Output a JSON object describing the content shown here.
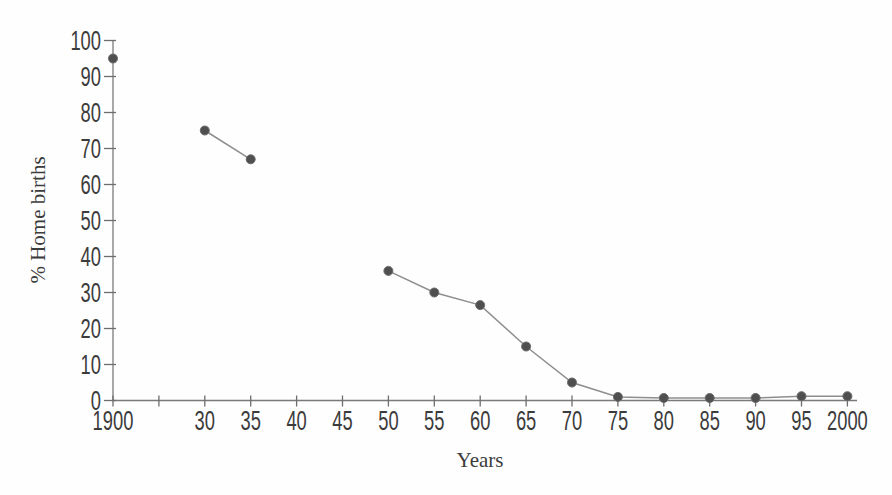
{
  "chart_data": {
    "type": "line",
    "xlabel": "Years",
    "ylabel": "% Home births",
    "x_tick_labels": [
      "1900",
      "",
      "30",
      "35",
      "40",
      "45",
      "50",
      "55",
      "60",
      "65",
      "70",
      "75",
      "80",
      "85",
      "90",
      "95",
      "2000"
    ],
    "y_tick_labels": [
      "0",
      "10",
      "20",
      "30",
      "40",
      "50",
      "60",
      "70",
      "80",
      "90",
      "100"
    ],
    "ylim": [
      0,
      100
    ],
    "grid": false,
    "legend": "none",
    "colors": {
      "axis": "#7a7a7a",
      "tick": "#6e6e6e",
      "text": "#3c3c3c",
      "line": "#8e8e8e",
      "marker": "#4f4f4f",
      "marker_edge": "#6b6b6b"
    },
    "series": [
      {
        "name": "% Home births",
        "marker": "circle",
        "segments": [
          [
            {
              "year": "1900",
              "tick_index": 0,
              "value": 95
            }
          ],
          [
            {
              "year": "1930",
              "tick_index": 2,
              "value": 75
            },
            {
              "year": "1935",
              "tick_index": 3,
              "value": 67
            }
          ],
          [
            {
              "year": "1950",
              "tick_index": 6,
              "value": 36
            },
            {
              "year": "1955",
              "tick_index": 7,
              "value": 30
            },
            {
              "year": "1960",
              "tick_index": 8,
              "value": 26.5
            },
            {
              "year": "1965",
              "tick_index": 9,
              "value": 15
            },
            {
              "year": "1970",
              "tick_index": 10,
              "value": 5
            },
            {
              "year": "1975",
              "tick_index": 11,
              "value": 1
            },
            {
              "year": "1980",
              "tick_index": 12,
              "value": 0.7
            },
            {
              "year": "1985",
              "tick_index": 13,
              "value": 0.7
            },
            {
              "year": "1990",
              "tick_index": 14,
              "value": 0.7
            },
            {
              "year": "1995",
              "tick_index": 15,
              "value": 1.2
            },
            {
              "year": "2000",
              "tick_index": 16,
              "value": 1.2
            }
          ]
        ]
      }
    ]
  }
}
